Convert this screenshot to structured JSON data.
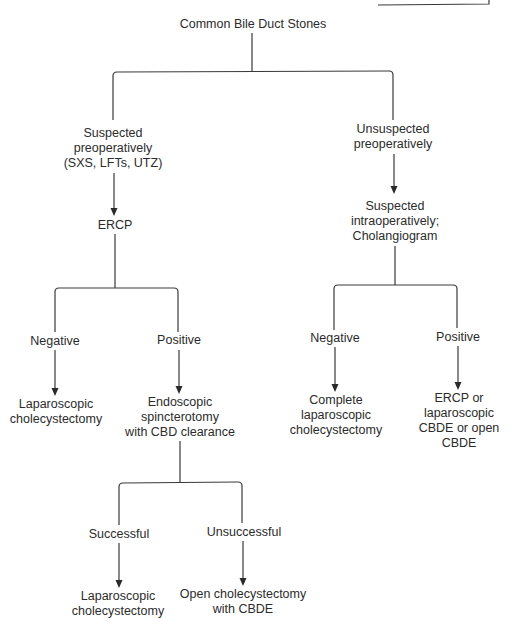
{
  "diagram": {
    "type": "flowchart",
    "title": "Common Bile Duct Stones",
    "nodes": {
      "root": {
        "lines": [
          "Common Bile Duct Stones"
        ]
      },
      "suspected_preop": {
        "lines": [
          "Suspected",
          "preoperatively",
          "(SXS, LFTs, UTZ)"
        ]
      },
      "unsuspected_preop": {
        "lines": [
          "Unsuspected",
          "preoperatively"
        ]
      },
      "ercp": {
        "lines": [
          "ERCP"
        ]
      },
      "suspected_intraop": {
        "lines": [
          "Suspected",
          "intraoperatively;",
          "Cholangiogram"
        ]
      },
      "ercp_negative": {
        "lines": [
          "Negative"
        ]
      },
      "ercp_positive": {
        "lines": [
          "Positive"
        ]
      },
      "chol_negative": {
        "lines": [
          "Negative"
        ]
      },
      "chol_positive": {
        "lines": [
          "Positive"
        ]
      },
      "lap_chole_1": {
        "lines": [
          "Laparoscopic",
          "cholecystectomy"
        ]
      },
      "endoscopic_sphincterotomy": {
        "lines": [
          "Endoscopic",
          "spincterotomy",
          "with CBD clearance"
        ]
      },
      "complete_lap_chole": {
        "lines": [
          "Complete",
          "laparoscopic",
          "cholecystectomy"
        ]
      },
      "ercp_or_cbde": {
        "lines": [
          "ERCP or",
          "laparoscopic",
          "CBDE or open",
          "CBDE"
        ]
      },
      "successful": {
        "lines": [
          "Successful"
        ]
      },
      "unsuccessful": {
        "lines": [
          "Unsuccessful"
        ]
      },
      "lap_chole_2": {
        "lines": [
          "Laparoscopic",
          "cholecystectomy"
        ]
      },
      "open_chole_cbde": {
        "lines": [
          "Open cholecystectomy",
          "with CBDE"
        ]
      }
    },
    "edges": [
      {
        "from": "root",
        "to": "suspected_preop"
      },
      {
        "from": "root",
        "to": "unsuspected_preop"
      },
      {
        "from": "suspected_preop",
        "to": "ercp",
        "arrow": true
      },
      {
        "from": "ercp",
        "to": "ercp_negative"
      },
      {
        "from": "ercp",
        "to": "ercp_positive"
      },
      {
        "from": "ercp_negative",
        "to": "lap_chole_1",
        "arrow": true
      },
      {
        "from": "ercp_positive",
        "to": "endoscopic_sphincterotomy",
        "arrow": true
      },
      {
        "from": "endoscopic_sphincterotomy",
        "to": "successful"
      },
      {
        "from": "endoscopic_sphincterotomy",
        "to": "unsuccessful"
      },
      {
        "from": "successful",
        "to": "lap_chole_2",
        "arrow": true
      },
      {
        "from": "unsuccessful",
        "to": "open_chole_cbde",
        "arrow": true
      },
      {
        "from": "unsuspected_preop",
        "to": "suspected_intraop",
        "arrow": true
      },
      {
        "from": "suspected_intraop",
        "to": "chol_negative"
      },
      {
        "from": "suspected_intraop",
        "to": "chol_positive"
      },
      {
        "from": "chol_negative",
        "to": "complete_lap_chole",
        "arrow": true
      },
      {
        "from": "chol_positive",
        "to": "ercp_or_cbde",
        "arrow": true
      }
    ]
  }
}
